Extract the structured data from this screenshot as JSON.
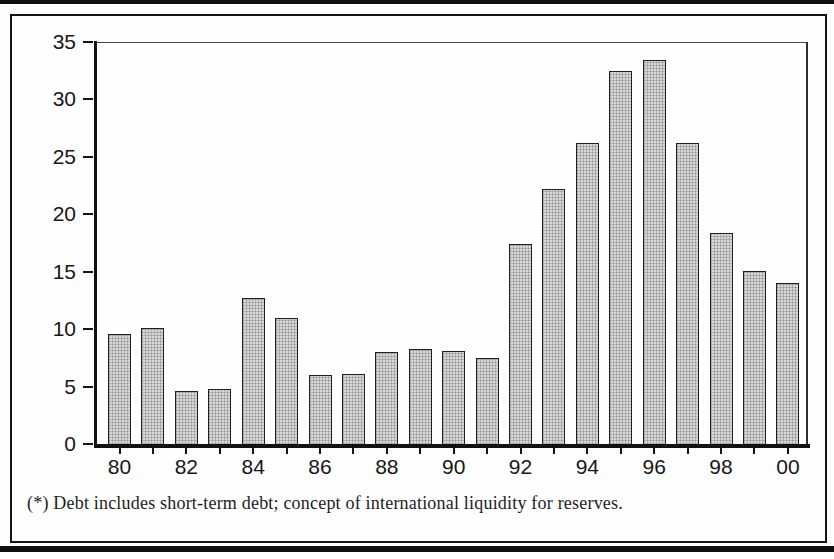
{
  "figure": {
    "footnote": "(*) Debt includes short-term debt; concept of international liquidity for reserves."
  },
  "chart_data": {
    "type": "bar",
    "categories": [
      1980,
      1981,
      1982,
      1983,
      1984,
      1985,
      1986,
      1987,
      1988,
      1989,
      1990,
      1991,
      1992,
      1993,
      1994,
      1995,
      1996,
      1997,
      1998,
      1999,
      2000
    ],
    "values": [
      9.6,
      10.1,
      4.6,
      4.8,
      12.7,
      11.0,
      6.0,
      6.1,
      8.0,
      8.3,
      8.1,
      7.5,
      17.4,
      22.2,
      26.2,
      32.5,
      33.4,
      26.2,
      18.4,
      15.1,
      14.0
    ],
    "x_tick_labels": [
      "80",
      "82",
      "84",
      "86",
      "88",
      "90",
      "92",
      "94",
      "96",
      "98",
      "00"
    ],
    "y_ticks": [
      0,
      5,
      10,
      15,
      20,
      25,
      30,
      35
    ],
    "ylim": [
      0,
      35
    ],
    "title": "",
    "xlabel": "",
    "ylabel": "",
    "grid": false,
    "legend": null,
    "colors": {
      "bar_fill": "#d7d7d5",
      "bar_border": "#1f1f1f",
      "axis": "#141414",
      "text": "#161616"
    }
  }
}
